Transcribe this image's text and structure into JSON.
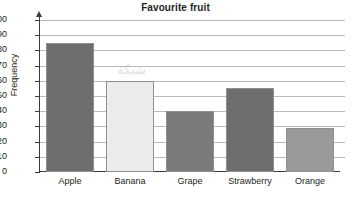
{
  "chart_data": {
    "type": "bar",
    "title": "Favourite fruit",
    "xlabel": "",
    "ylabel": "Frequency",
    "categories": [
      "Apple",
      "Banana",
      "Grape",
      "Strawberry",
      "Orange"
    ],
    "values": [
      85,
      60,
      40,
      55,
      29
    ],
    "ylim": [
      0,
      100
    ],
    "ytick_labels": [
      "0",
      "10",
      "20",
      "30",
      "40",
      "50",
      "60",
      "70",
      "80",
      "90",
      "100"
    ],
    "ytick_values": [
      0,
      10,
      20,
      30,
      40,
      50,
      60,
      70,
      80,
      90,
      100
    ],
    "grid": true,
    "legend": false,
    "bar_colors": [
      "#6e6e6e",
      "#ececec",
      "#7a7a7a",
      "#6e6e6e",
      "#9a9a9a"
    ],
    "bar_border_color": "#8f8f8f",
    "axis_color": "#3a3a3a",
    "grid_color": "#b9b9b9",
    "text_color": "#231f20",
    "background": "#ffffff"
  },
  "watermark": {
    "line1": "شبكة",
    "line2": "معلومات"
  }
}
